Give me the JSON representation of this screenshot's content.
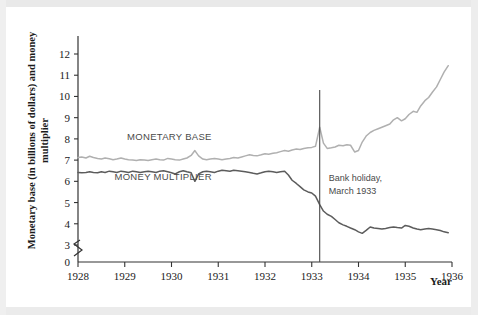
{
  "chart_data": {
    "type": "line",
    "title": "",
    "xlabel": "Year",
    "ylabel": "Monetary base (in billions of dollars) and money multiplier",
    "xlim": [
      1928,
      1936
    ],
    "ylim": [
      3,
      12
    ],
    "y_axis_break": true,
    "y_axis_break_label": "0",
    "grid": false,
    "legend_position": "inline-labels",
    "xticks": [
      "1928",
      "1929",
      "1930",
      "1931",
      "1932",
      "1933",
      "1934",
      "1935",
      "1936"
    ],
    "yticks": [
      "3",
      "4",
      "5",
      "6",
      "7",
      "8",
      "9",
      "10",
      "11",
      "12"
    ],
    "annotations": [
      {
        "name": "bank-holiday",
        "text_line1": "Bank holiday,",
        "text_line2": "March 1933",
        "x": 1933.17,
        "type": "vertical-line-with-caption"
      }
    ],
    "series": [
      {
        "name": "MONETARY BASE",
        "color": "#b0b0b0",
        "label_x": 1929.05,
        "label_y": 7.95,
        "x": [
          1928.0,
          1928.08,
          1928.17,
          1928.25,
          1928.33,
          1928.42,
          1928.5,
          1928.58,
          1928.67,
          1928.75,
          1928.83,
          1928.92,
          1929.0,
          1929.08,
          1929.17,
          1929.25,
          1929.33,
          1929.42,
          1929.5,
          1929.58,
          1929.67,
          1929.75,
          1929.83,
          1929.92,
          1930.0,
          1930.08,
          1930.17,
          1930.25,
          1930.33,
          1930.42,
          1930.5,
          1930.58,
          1930.67,
          1930.75,
          1930.83,
          1930.92,
          1931.0,
          1931.08,
          1931.17,
          1931.25,
          1931.33,
          1931.42,
          1931.5,
          1931.58,
          1931.67,
          1931.75,
          1931.83,
          1931.92,
          1932.0,
          1932.08,
          1932.17,
          1932.25,
          1932.33,
          1932.42,
          1932.5,
          1932.58,
          1932.67,
          1932.75,
          1932.83,
          1932.92,
          1933.0,
          1933.08,
          1933.17,
          1933.25,
          1933.33,
          1933.42,
          1933.5,
          1933.58,
          1933.67,
          1933.75,
          1933.83,
          1933.92,
          1934.0,
          1934.08,
          1934.17,
          1934.25,
          1934.33,
          1934.42,
          1934.5,
          1934.58,
          1934.67,
          1934.75,
          1934.83,
          1934.92,
          1935.0,
          1935.08,
          1935.17,
          1935.25,
          1935.33,
          1935.42,
          1935.5,
          1935.58,
          1935.67,
          1935.75,
          1935.83,
          1935.92
        ],
        "y": [
          7.12,
          7.15,
          7.1,
          7.18,
          7.12,
          7.08,
          7.05,
          7.1,
          7.06,
          7.02,
          7.05,
          7.1,
          7.05,
          7.02,
          7.0,
          6.98,
          7.02,
          7.0,
          6.98,
          7.02,
          7.05,
          7.02,
          7.0,
          7.08,
          7.05,
          7.02,
          7.0,
          7.05,
          7.1,
          7.22,
          7.45,
          7.2,
          7.05,
          7.02,
          7.05,
          7.08,
          7.05,
          7.02,
          7.05,
          7.08,
          7.12,
          7.1,
          7.15,
          7.2,
          7.25,
          7.22,
          7.2,
          7.25,
          7.3,
          7.28,
          7.32,
          7.35,
          7.4,
          7.45,
          7.42,
          7.48,
          7.52,
          7.5,
          7.55,
          7.58,
          7.6,
          7.65,
          8.55,
          7.8,
          7.55,
          7.58,
          7.62,
          7.7,
          7.68,
          7.72,
          7.7,
          7.38,
          7.45,
          7.85,
          8.15,
          8.3,
          8.4,
          8.48,
          8.55,
          8.62,
          8.7,
          8.9,
          9.0,
          8.85,
          8.95,
          9.15,
          9.3,
          9.25,
          9.55,
          9.8,
          9.95,
          10.2,
          10.45,
          10.8,
          11.15,
          11.45
        ]
      },
      {
        "name": "MONEY MULTIPLIER",
        "color": "#5c5c5c",
        "label_x": 1928.78,
        "label_y": 6.05,
        "x": [
          1928.0,
          1928.08,
          1928.17,
          1928.25,
          1928.33,
          1928.42,
          1928.5,
          1928.58,
          1928.67,
          1928.75,
          1928.83,
          1928.92,
          1929.0,
          1929.08,
          1929.17,
          1929.25,
          1929.33,
          1929.42,
          1929.5,
          1929.58,
          1929.67,
          1929.75,
          1929.83,
          1929.92,
          1930.0,
          1930.08,
          1930.17,
          1930.25,
          1930.33,
          1930.42,
          1930.5,
          1930.58,
          1930.67,
          1930.75,
          1930.83,
          1930.92,
          1931.0,
          1931.08,
          1931.17,
          1931.25,
          1931.33,
          1931.42,
          1931.5,
          1931.58,
          1931.67,
          1931.75,
          1931.83,
          1931.92,
          1932.0,
          1932.08,
          1932.17,
          1932.25,
          1932.33,
          1932.42,
          1932.5,
          1932.58,
          1932.67,
          1932.75,
          1932.83,
          1932.92,
          1933.0,
          1933.08,
          1933.17,
          1933.25,
          1933.33,
          1933.42,
          1933.5,
          1933.58,
          1933.67,
          1933.75,
          1933.83,
          1933.92,
          1934.0,
          1934.08,
          1934.17,
          1934.25,
          1934.33,
          1934.42,
          1934.5,
          1934.58,
          1934.67,
          1934.75,
          1934.83,
          1934.92,
          1935.0,
          1935.08,
          1935.17,
          1935.25,
          1935.33,
          1935.42,
          1935.5,
          1935.58,
          1935.67,
          1935.75,
          1935.83,
          1935.92
        ],
        "y": [
          6.42,
          6.4,
          6.42,
          6.45,
          6.42,
          6.4,
          6.45,
          6.42,
          6.48,
          6.45,
          6.42,
          6.48,
          6.45,
          6.42,
          6.48,
          6.45,
          6.42,
          6.45,
          6.48,
          6.45,
          6.42,
          6.48,
          6.5,
          6.45,
          6.4,
          6.35,
          6.45,
          6.5,
          6.45,
          6.4,
          6.0,
          6.35,
          6.45,
          6.48,
          6.45,
          6.42,
          6.48,
          6.52,
          6.5,
          6.48,
          6.52,
          6.5,
          6.48,
          6.45,
          6.42,
          6.38,
          6.35,
          6.4,
          6.45,
          6.48,
          6.45,
          6.42,
          6.45,
          6.48,
          6.3,
          6.05,
          5.9,
          5.75,
          5.6,
          5.5,
          5.45,
          5.3,
          4.9,
          4.6,
          4.45,
          4.35,
          4.2,
          4.05,
          3.95,
          3.88,
          3.8,
          3.72,
          3.62,
          3.55,
          3.7,
          3.85,
          3.8,
          3.78,
          3.75,
          3.78,
          3.82,
          3.85,
          3.82,
          3.8,
          3.92,
          3.88,
          3.8,
          3.75,
          3.72,
          3.75,
          3.78,
          3.75,
          3.72,
          3.68,
          3.62,
          3.58
        ]
      }
    ]
  }
}
